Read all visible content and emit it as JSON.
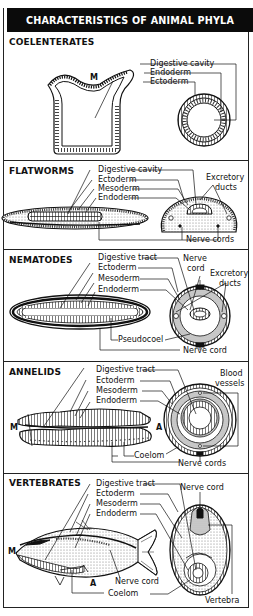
{
  "title": "CHARACTERISTICS OF ANIMAL PHYLA",
  "sections": [
    {
      "name": "COELENTERATES",
      "labels": {
        "l1": "Digestive cavity",
        "l2": "Endoderm",
        "l3": "Ectoderm",
        "mouth": "M"
      }
    },
    {
      "name": "FLATWORMS",
      "labels": {
        "l1": "Digestive cavity",
        "l2": "Ectoderm",
        "l3": "Mesoderm",
        "l4": "Endoderm",
        "excretory_1": "Excretory",
        "excretory_2": "ducts",
        "nerve": "Nerve cords"
      }
    },
    {
      "name": "NEMATODES",
      "labels": {
        "l1": "Digestive tract",
        "l2": "Ectoderm",
        "l3": "Mesoderm",
        "l4": "Endoderm",
        "nerve_top_1": "Nerve",
        "nerve_top_2": "cord",
        "excretory_1": "Excretory",
        "excretory_2": "ducts",
        "pseudocoel": "Pseudocoel",
        "nerve": "Nerve cord"
      }
    },
    {
      "name": "ANNELIDS",
      "labels": {
        "l1": "Digestive tract",
        "l2": "Ectoderm",
        "l3": "Mesoderm",
        "l4": "Endoderm",
        "blood_1": "Blood",
        "blood_2": "vessels",
        "mouth": "M",
        "anus": "A",
        "coelom": "Coelom",
        "nerve": "Nerve cords"
      }
    },
    {
      "name": "VERTEBRATES",
      "labels": {
        "l1": "Digestive tract",
        "l2": "Ectoderm",
        "l3": "Mesoderm",
        "l4": "Endoderm",
        "nerve_top": "Nerve cord",
        "mouth": "M",
        "anus": "A",
        "nerve": "Nerve cord",
        "coelom": "Coelom",
        "vertebra": "Vertebra"
      }
    }
  ],
  "colors": {
    "ink": "#111111",
    "header_bg": "#0b0b0b",
    "header_text": "#ffffff",
    "stipple": "#bdbdbd",
    "paper": "#ffffff"
  }
}
